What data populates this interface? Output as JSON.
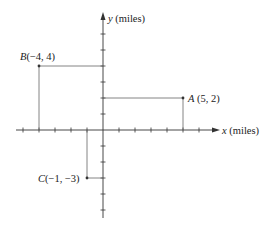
{
  "diagram": {
    "type": "coordinate-plane",
    "x_axis_label": "x (miles)",
    "x_axis_var": "x",
    "x_axis_unit": "(miles)",
    "y_axis_label": "y (miles)",
    "y_axis_var": "y",
    "y_axis_unit": "(miles)",
    "x_range": [
      -5,
      6
    ],
    "y_range": [
      -5,
      6
    ],
    "tick_spacing": 1,
    "points": [
      {
        "name": "A",
        "coords": "(5, 2)",
        "x": 5,
        "y": 2
      },
      {
        "name": "B",
        "coords": "(−4, 4)",
        "x": -4,
        "y": 4
      },
      {
        "name": "C",
        "coords": "(−1, −3)",
        "x": -1,
        "y": -3
      }
    ],
    "colors": {
      "axis": "#333333",
      "guide": "#555555",
      "point": "#333333"
    }
  }
}
